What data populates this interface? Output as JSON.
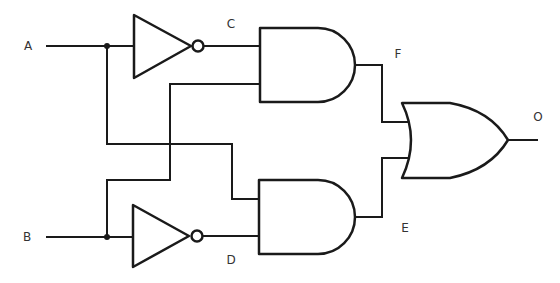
{
  "diagram": {
    "labels": {
      "A": "A",
      "B": "B",
      "C": "C",
      "D": "D",
      "E": "E",
      "F": "F",
      "O": "O"
    },
    "gates": [
      {
        "id": "not1",
        "type": "NOT",
        "input": "A",
        "output": "C"
      },
      {
        "id": "not2",
        "type": "NOT",
        "input": "B",
        "output": "D"
      },
      {
        "id": "and1",
        "type": "AND",
        "inputs": [
          "C",
          "B"
        ],
        "output": "F"
      },
      {
        "id": "and2",
        "type": "AND",
        "inputs": [
          "A",
          "D"
        ],
        "output": "E"
      },
      {
        "id": "or1",
        "type": "OR",
        "inputs": [
          "F",
          "E"
        ],
        "output": "O"
      }
    ],
    "colors": {
      "stroke": "#1a1a1a",
      "label": "#333333",
      "background": "#ffffff"
    }
  }
}
